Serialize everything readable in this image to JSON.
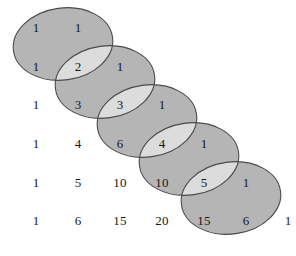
{
  "figure": {
    "width": 296,
    "height": 256,
    "background_color": "#ffffff",
    "text_color": "#171717"
  },
  "chart_data": {
    "type": "diagram",
    "xlabel": "",
    "ylabel": "",
    "grid": false,
    "legend": "none",
    "rows": [
      {
        "index": 0,
        "values": [
          1,
          1
        ]
      },
      {
        "index": 1,
        "values": [
          1,
          2,
          1
        ]
      },
      {
        "index": 2,
        "values": [
          1,
          3,
          3,
          1
        ]
      },
      {
        "index": 3,
        "values": [
          1,
          4,
          6,
          4,
          1
        ]
      },
      {
        "index": 4,
        "values": [
          1,
          5,
          10,
          10,
          5,
          1
        ]
      },
      {
        "index": 5,
        "values": [
          1,
          6,
          15,
          20,
          15,
          6,
          1
        ]
      }
    ],
    "layout": {
      "col_x": [
        36,
        78,
        120,
        162,
        204,
        246,
        288
      ],
      "row_y": [
        28,
        67,
        105,
        144,
        183,
        221
      ],
      "col_step": 42,
      "row_step": 38.6
    },
    "ellipses": [
      {
        "id": 1,
        "cx": 63,
        "cy": 44,
        "rx": 50,
        "ry": 36,
        "rotate": -8
      },
      {
        "id": 2,
        "cx": 105,
        "cy": 82,
        "rx": 50,
        "ry": 36,
        "rotate": -8
      },
      {
        "id": 3,
        "cx": 147,
        "cy": 121,
        "rx": 50,
        "ry": 36,
        "rotate": -8
      },
      {
        "id": 4,
        "cx": 189,
        "cy": 159,
        "rx": 50,
        "ry": 36,
        "rotate": -8
      },
      {
        "id": 5,
        "cx": 231,
        "cy": 198,
        "rx": 50,
        "ry": 36,
        "rotate": -8
      }
    ],
    "colors": {
      "ellipse_fill": "#b5b5b5",
      "ellipse_overlap_fill": "#dcdcdc",
      "ellipse_stroke": "#4a4a4a",
      "number_color": "#171717"
    },
    "numbers": [
      {
        "row": 0,
        "col": 0,
        "value": 1,
        "x": 36,
        "y": 28,
        "inside_ellipse": true
      },
      {
        "row": 0,
        "col": 1,
        "value": 1,
        "x": 78,
        "y": 28,
        "inside_ellipse": true
      },
      {
        "row": 1,
        "col": 0,
        "value": 1,
        "x": 36,
        "y": 67,
        "inside_ellipse": true
      },
      {
        "row": 1,
        "col": 1,
        "value": 2,
        "x": 78,
        "y": 67,
        "inside_ellipse": true
      },
      {
        "row": 1,
        "col": 2,
        "value": 1,
        "x": 120,
        "y": 67,
        "inside_ellipse": true
      },
      {
        "row": 2,
        "col": 0,
        "value": 1,
        "x": 36,
        "y": 105,
        "inside_ellipse": false
      },
      {
        "row": 2,
        "col": 1,
        "value": 3,
        "x": 78,
        "y": 105,
        "inside_ellipse": true
      },
      {
        "row": 2,
        "col": 2,
        "value": 3,
        "x": 120,
        "y": 105,
        "inside_ellipse": true
      },
      {
        "row": 2,
        "col": 3,
        "value": 1,
        "x": 162,
        "y": 105,
        "inside_ellipse": true
      },
      {
        "row": 3,
        "col": 0,
        "value": 1,
        "x": 36,
        "y": 144,
        "inside_ellipse": false
      },
      {
        "row": 3,
        "col": 1,
        "value": 4,
        "x": 78,
        "y": 144,
        "inside_ellipse": false
      },
      {
        "row": 3,
        "col": 2,
        "value": 6,
        "x": 120,
        "y": 144,
        "inside_ellipse": true
      },
      {
        "row": 3,
        "col": 3,
        "value": 4,
        "x": 162,
        "y": 144,
        "inside_ellipse": true
      },
      {
        "row": 3,
        "col": 4,
        "value": 1,
        "x": 204,
        "y": 144,
        "inside_ellipse": true
      },
      {
        "row": 4,
        "col": 0,
        "value": 1,
        "x": 36,
        "y": 183,
        "inside_ellipse": false
      },
      {
        "row": 4,
        "col": 1,
        "value": 5,
        "x": 78,
        "y": 183,
        "inside_ellipse": false
      },
      {
        "row": 4,
        "col": 2,
        "value": 10,
        "x": 120,
        "y": 183,
        "inside_ellipse": false
      },
      {
        "row": 4,
        "col": 3,
        "value": 10,
        "x": 162,
        "y": 183,
        "inside_ellipse": true
      },
      {
        "row": 4,
        "col": 4,
        "value": 5,
        "x": 204,
        "y": 183,
        "inside_ellipse": true
      },
      {
        "row": 4,
        "col": 5,
        "value": 1,
        "x": 246,
        "y": 183,
        "inside_ellipse": true
      },
      {
        "row": 5,
        "col": 0,
        "value": 1,
        "x": 36,
        "y": 221,
        "inside_ellipse": false
      },
      {
        "row": 5,
        "col": 1,
        "value": 6,
        "x": 78,
        "y": 221,
        "inside_ellipse": false
      },
      {
        "row": 5,
        "col": 2,
        "value": 15,
        "x": 120,
        "y": 221,
        "inside_ellipse": false
      },
      {
        "row": 5,
        "col": 3,
        "value": 20,
        "x": 162,
        "y": 221,
        "inside_ellipse": false
      },
      {
        "row": 5,
        "col": 4,
        "value": 15,
        "x": 204,
        "y": 221,
        "inside_ellipse": true
      },
      {
        "row": 5,
        "col": 5,
        "value": 6,
        "x": 246,
        "y": 221,
        "inside_ellipse": true
      },
      {
        "row": 5,
        "col": 6,
        "value": 1,
        "x": 288,
        "y": 221,
        "inside_ellipse": false
      }
    ]
  }
}
